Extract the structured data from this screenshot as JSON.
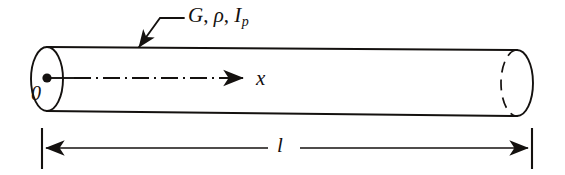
{
  "figure": {
    "kind": "engineering-diagram",
    "background_color": "#ffffff",
    "ink_color": "#14110f"
  },
  "labels": {
    "properties": {
      "shear_modulus": "G",
      "separator_1": ", ",
      "density": "ρ",
      "separator_2": ", ",
      "polar_moment": "I",
      "polar_moment_subscript": "p"
    },
    "origin": "0",
    "axis": "x",
    "length": "l"
  },
  "geometry": {
    "left_end": {
      "name": "left-end-cap",
      "shape": "ellipse",
      "center_x": 47,
      "center_y": 79,
      "rx": 16,
      "ry": 32,
      "style": "solid"
    },
    "right_end": {
      "name": "right-end-cap",
      "shape": "ellipse",
      "center_x": 517,
      "center_y": 83,
      "rx": 16,
      "ry": 33,
      "front_arc_style": "solid",
      "hidden_arc_style": "dashed"
    },
    "top_edge": {
      "x1": 47,
      "y1": 47,
      "x2": 517,
      "y2": 50
    },
    "bottom_edge": {
      "x1": 47,
      "y1": 111,
      "x2": 517,
      "y2": 116
    },
    "center_dot": {
      "cx": 47,
      "cy": 78,
      "r": 4.5
    },
    "axis_line": {
      "x1": 47,
      "y1": 78,
      "x2": 247,
      "y2": 78,
      "style": "dash-dot",
      "arrow": "end"
    },
    "leader": {
      "elbow_x": 184,
      "elbow_y": 18,
      "corner_x": 160,
      "corner_y": 18,
      "tip_x": 139,
      "tip_y": 47,
      "arrow": "end"
    },
    "dimension": {
      "y": 148,
      "left_tick_x": 42,
      "right_tick_x": 532,
      "tick_top": 128,
      "tick_bottom": 169,
      "gap_left": 268,
      "gap_right": 300,
      "arrows": "both"
    }
  }
}
